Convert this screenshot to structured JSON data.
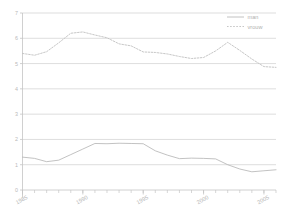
{
  "chart_data": {
    "type": "line",
    "title": "",
    "subtitle": "",
    "xlabel": "",
    "ylabel": "",
    "xlim": [
      1985,
      2006
    ],
    "ylim": [
      0,
      7
    ],
    "yticks": [
      0,
      1,
      2,
      3,
      4,
      5,
      6,
      7
    ],
    "ytick_labels": [
      "0",
      "1",
      "2",
      "3",
      "4",
      "5",
      "6",
      "7"
    ],
    "xticks": [
      1985,
      1990,
      1995,
      2000,
      2005
    ],
    "xtick_labels": [
      "1985",
      "1990",
      "1995",
      "2000",
      "2005"
    ],
    "x_minor_ticks": [
      1985,
      1986,
      1987,
      1988,
      1989,
      1990,
      1991,
      1992,
      1993,
      1994,
      1995,
      1996,
      1997,
      1998,
      1999,
      2000,
      2001,
      2002,
      2003,
      2004,
      2005,
      2006
    ],
    "grid": "horizontal",
    "legend_position": "top-right",
    "x": [
      1985,
      1986,
      1987,
      1988,
      1989,
      1990,
      1991,
      1992,
      1993,
      1994,
      1995,
      1996,
      1997,
      1998,
      1999,
      2000,
      2001,
      2002,
      2003,
      2004,
      2005,
      2006
    ],
    "series": [
      {
        "name": "man",
        "style": "solid",
        "color": "#b3b3b3",
        "values": [
          1.3,
          1.25,
          1.12,
          1.18,
          1.4,
          1.62,
          1.84,
          1.83,
          1.85,
          1.84,
          1.83,
          1.55,
          1.38,
          1.24,
          1.26,
          1.25,
          1.23,
          1.0,
          0.83,
          0.72,
          0.76,
          0.8
        ]
      },
      {
        "name": "vrouw",
        "style": "dotted",
        "color": "#c0c0c0",
        "values": [
          5.4,
          5.33,
          5.47,
          5.82,
          6.2,
          6.25,
          6.13,
          6.02,
          5.78,
          5.7,
          5.46,
          5.44,
          5.38,
          5.28,
          5.2,
          5.24,
          5.5,
          5.84,
          5.52,
          5.18,
          4.88,
          4.85
        ]
      }
    ]
  },
  "legend": {
    "items": [
      {
        "label": "man",
        "style": "solid"
      },
      {
        "label": "vrouw",
        "style": "dotted"
      }
    ]
  },
  "colors": {
    "man_line": "#b3b3b3",
    "vrouw_line": "#c0c0c0",
    "gridline": "#cfcfcf",
    "axis": "#c4c4c4",
    "tick_text": "#b5b5b5",
    "background": "#ffffff"
  }
}
